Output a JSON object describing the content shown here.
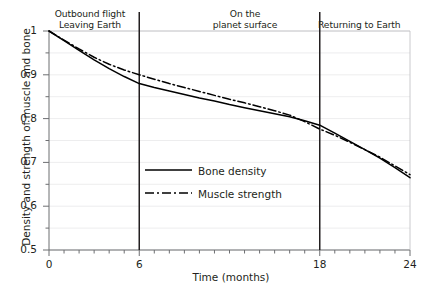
{
  "chart_data": {
    "type": "line",
    "title": "",
    "xlabel": "Time (months)",
    "ylabel": "Density and strength of muscle and bone",
    "xlim": [
      0,
      24
    ],
    "ylim": [
      0.5,
      1.0
    ],
    "grid": true,
    "grid_color": "#e8e8ea",
    "legend_position": "inside-center-left",
    "x_ticks": [
      {
        "value": 0,
        "label": "0"
      },
      {
        "value": 6,
        "label": "6"
      },
      {
        "value": 18,
        "label": "18"
      },
      {
        "value": 24,
        "label": "24"
      }
    ],
    "x_minor_tick_step": 1,
    "y_ticks": [
      {
        "value": 1.0,
        "label": "1"
      },
      {
        "value": 0.9,
        "label": "0.9"
      },
      {
        "value": 0.8,
        "label": "0.8"
      },
      {
        "value": 0.7,
        "label": "0.7"
      },
      {
        "value": 0.6,
        "label": "0.6"
      },
      {
        "value": 0.5,
        "label": "0.5"
      }
    ],
    "y_minor_tick_step": 0.05,
    "x": [
      0,
      1,
      2,
      3,
      4,
      5,
      6,
      7,
      8,
      9,
      10,
      11,
      12,
      13,
      14,
      15,
      16,
      17,
      18,
      19,
      20,
      21,
      22,
      23,
      24
    ],
    "series": [
      {
        "name": "Bone density",
        "style": "solid",
        "color": "#000000",
        "values": [
          1.0,
          0.978,
          0.956,
          0.934,
          0.914,
          0.896,
          0.88,
          0.871,
          0.863,
          0.855,
          0.847,
          0.84,
          0.832,
          0.825,
          0.818,
          0.811,
          0.804,
          0.795,
          0.785,
          0.767,
          0.748,
          0.729,
          0.71,
          0.688,
          0.665
        ]
      },
      {
        "name": "Muscle strength",
        "style": "dash-dot",
        "color": "#000000",
        "values": [
          1.0,
          0.979,
          0.959,
          0.94,
          0.924,
          0.911,
          0.9,
          0.89,
          0.88,
          0.871,
          0.862,
          0.853,
          0.844,
          0.836,
          0.827,
          0.818,
          0.808,
          0.793,
          0.776,
          0.762,
          0.746,
          0.729,
          0.712,
          0.692,
          0.672
        ]
      }
    ],
    "phases": [
      {
        "label": "Outbound flight\nLeaving Earth",
        "start": 0,
        "end": 6
      },
      {
        "label": "On the\nplanet surface",
        "start": 6,
        "end": 18
      },
      {
        "label": "Returning to Earth",
        "start": 18,
        "end": 24
      }
    ],
    "phase_dividers": [
      6,
      18
    ],
    "legend": [
      {
        "label": "Bone density",
        "style": "solid"
      },
      {
        "label": "Muscle strength",
        "style": "dash-dot"
      }
    ]
  }
}
